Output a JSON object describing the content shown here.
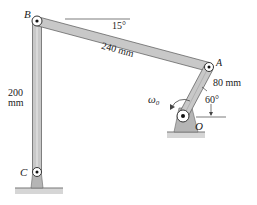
{
  "diagram": {
    "type": "four-bar linkage",
    "points": {
      "B": {
        "label": "B"
      },
      "A": {
        "label": "A"
      },
      "C": {
        "label": "C"
      },
      "O": {
        "label": "O"
      }
    },
    "links": {
      "BA": {
        "length_label": "240 mm"
      },
      "BC": {
        "length_label_line1": "200",
        "length_label_line2": "mm"
      },
      "OA": {
        "length_label": "80 mm"
      }
    },
    "angles": {
      "BA_from_horizontal": "15°",
      "OA_from_vertical": "60°"
    },
    "angular_velocity": {
      "symbol": "ω",
      "subscript": "0"
    },
    "colors": {
      "link_fill": "#c8c8c8",
      "link_stroke": "#555555",
      "ground_fill": "#b5b5b5",
      "pin_fill": "#ffffff",
      "text": "#222222"
    }
  }
}
